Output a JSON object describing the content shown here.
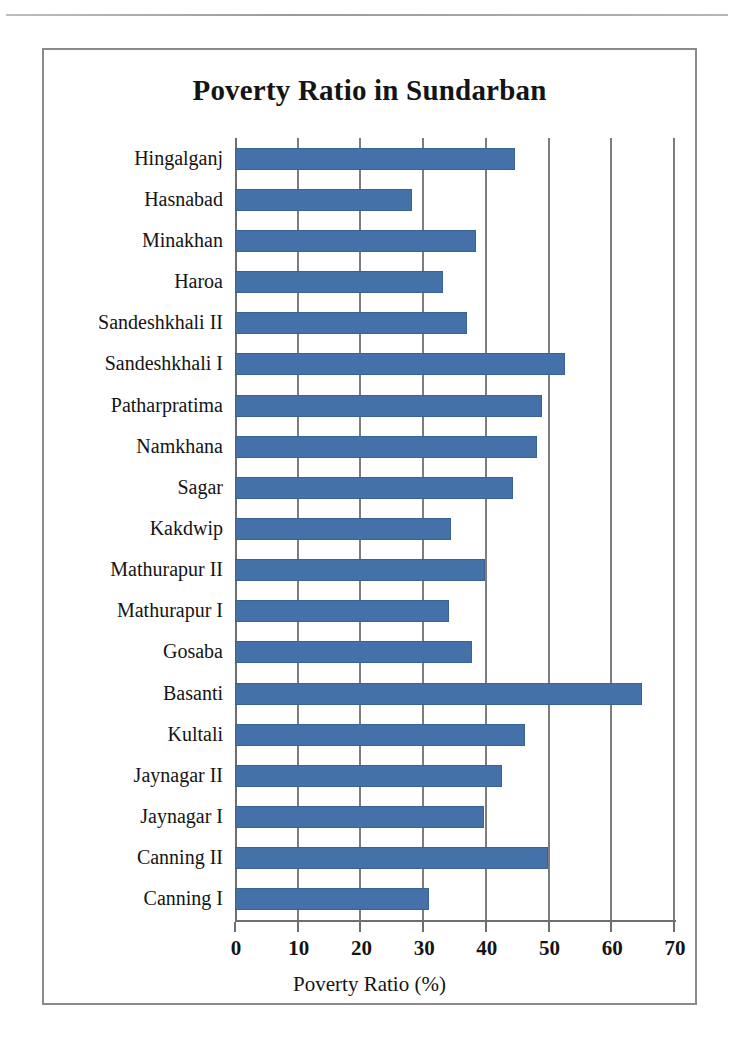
{
  "page": {
    "header_note": "",
    "figure_border_color": "#8a8a8a"
  },
  "chart": {
    "title": "Poverty Ratio in Sundarban",
    "x_axis_title": "Poverty Ratio (%)",
    "bar_color": "#4472A8",
    "gridline_color": "#7d7d7d",
    "axis_color": "#6e6e6e"
  },
  "chart_data": {
    "type": "bar",
    "orientation": "horizontal",
    "title": "Poverty Ratio in Sundarban",
    "xlabel": "Poverty Ratio (%)",
    "ylabel": "",
    "xlim": [
      0,
      70
    ],
    "xticks": [
      0,
      10,
      20,
      30,
      40,
      50,
      60,
      70
    ],
    "xtick_labels": [
      "0",
      "10",
      "20",
      "30",
      "40",
      "50",
      "60",
      "70"
    ],
    "grid": true,
    "grid_axis": "x",
    "legend": false,
    "series_name": "Poverty Ratio (%)",
    "bar_color": "#4472A8",
    "categories": [
      "Hingalganj",
      "Hasnabad",
      "Minakhan",
      "Haroa",
      "Sandeshkhali II",
      "Sandeshkhali I",
      "Patharpratima",
      "Namkhana",
      "Sagar",
      "Kakdwip",
      "Mathurapur II",
      "Mathurapur I",
      "Gosaba",
      "Basanti",
      "Kultali",
      "Jaynagar II",
      "Jaynagar I",
      "Canning II",
      "Canning I"
    ],
    "values": [
      44.6,
      28.3,
      38.4,
      33.2,
      37.0,
      52.6,
      48.9,
      48.2,
      44.3,
      34.5,
      39.8,
      34.1,
      37.8,
      64.9,
      46.3,
      42.6,
      39.7,
      49.9,
      31.0
    ]
  }
}
